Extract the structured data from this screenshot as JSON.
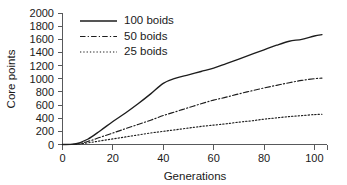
{
  "chart_data": {
    "type": "line",
    "title": "",
    "xlabel": "Generations",
    "ylabel": "Core points",
    "xlim": [
      0,
      105
    ],
    "ylim": [
      0,
      2000
    ],
    "xticks": [
      0,
      20,
      40,
      60,
      80,
      100
    ],
    "yticks": [
      0,
      200,
      400,
      600,
      800,
      1000,
      1200,
      1400,
      1600,
      1800,
      2000
    ],
    "grid": false,
    "legend_position": "top-left-inside",
    "series": [
      {
        "name": "100 boids",
        "style": "solid",
        "color": "#1d1d1d",
        "x": [
          0,
          5,
          10,
          15,
          20,
          25,
          30,
          35,
          40,
          45,
          50,
          55,
          60,
          65,
          70,
          75,
          80,
          85,
          90,
          95,
          100,
          103
        ],
        "values": [
          0,
          10,
          80,
          210,
          350,
          480,
          620,
          770,
          930,
          1010,
          1060,
          1110,
          1160,
          1230,
          1300,
          1370,
          1440,
          1510,
          1570,
          1600,
          1650,
          1670
        ]
      },
      {
        "name": "50 boids",
        "style": "dash-dot",
        "color": "#1d1d1d",
        "x": [
          0,
          5,
          10,
          15,
          20,
          25,
          30,
          35,
          40,
          45,
          50,
          55,
          60,
          65,
          70,
          75,
          80,
          85,
          90,
          95,
          100,
          103
        ],
        "values": [
          0,
          5,
          45,
          110,
          175,
          240,
          305,
          370,
          440,
          500,
          560,
          620,
          675,
          720,
          770,
          815,
          860,
          900,
          940,
          975,
          1000,
          1010
        ]
      },
      {
        "name": "25 boids",
        "style": "dotted",
        "color": "#1d1d1d",
        "x": [
          0,
          5,
          10,
          15,
          20,
          25,
          30,
          35,
          40,
          45,
          50,
          55,
          60,
          65,
          70,
          75,
          80,
          85,
          90,
          95,
          100,
          103
        ],
        "values": [
          0,
          3,
          25,
          55,
          85,
          115,
          145,
          175,
          200,
          225,
          250,
          275,
          295,
          315,
          340,
          360,
          385,
          405,
          425,
          440,
          455,
          460
        ]
      }
    ]
  },
  "axes": {
    "y_title": "Core points",
    "x_title": "Generations",
    "y_tick_labels": [
      "0",
      "200",
      "400",
      "600",
      "800",
      "1000",
      "1200",
      "1400",
      "1600",
      "1800",
      "2000"
    ],
    "x_tick_labels": [
      "0",
      "20",
      "40",
      "60",
      "80",
      "100"
    ]
  },
  "legend": {
    "entries": [
      {
        "label": "100 boids",
        "style": "solid"
      },
      {
        "label": "50 boids",
        "style": "dash-dot"
      },
      {
        "label": "25 boids",
        "style": "dotted"
      }
    ]
  }
}
